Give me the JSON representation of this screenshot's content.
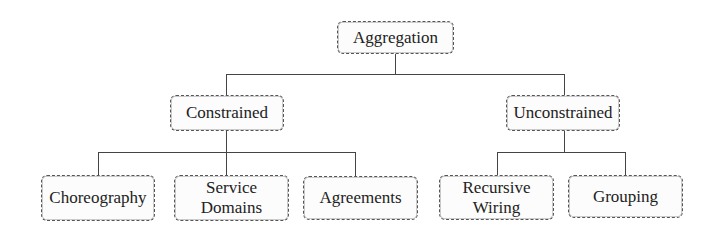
{
  "diagram": {
    "type": "hierarchy-tree",
    "root": {
      "label": "Aggregation"
    },
    "level1": [
      {
        "label": "Constrained",
        "children": [
          "Choreography",
          "Service\nDomains",
          "Agreements"
        ]
      },
      {
        "label": "Unconstrained",
        "children": [
          "Recursive\nWiring",
          "Grouping"
        ]
      }
    ],
    "leaves": [
      {
        "label": "Choreography",
        "parent": "Constrained"
      },
      {
        "label": "Service\nDomains",
        "parent": "Constrained"
      },
      {
        "label": "Agreements",
        "parent": "Constrained"
      },
      {
        "label": "Recursive\nWiring",
        "parent": "Unconstrained"
      },
      {
        "label": "Grouping",
        "parent": "Unconstrained"
      }
    ],
    "colors": {
      "line": "#444444",
      "border": "#555555",
      "text": "#222222",
      "background": "#ffffff"
    }
  }
}
